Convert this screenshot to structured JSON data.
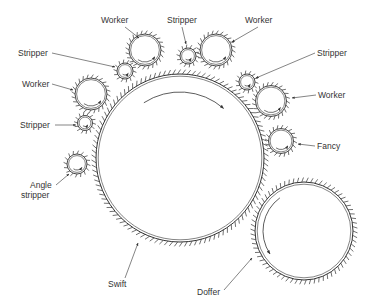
{
  "diagram": {
    "type": "carding-machine-roller-layout",
    "line_color": "#333333",
    "background": "#ffffff",
    "rollers": [
      {
        "id": "swift",
        "label": "Swift",
        "cx": 180,
        "cy": 158,
        "r": 84,
        "teeth": 110,
        "arrow": "clockwise-top"
      },
      {
        "id": "doffer",
        "label": "Doffer",
        "cx": 304,
        "cy": 231,
        "r": 49,
        "teeth": 70,
        "arrow": "counterclockwise-left"
      },
      {
        "id": "worker-top-left",
        "label": "Worker",
        "cx": 145,
        "cy": 50,
        "r": 16,
        "teeth": 24
      },
      {
        "id": "stripper-top",
        "label": "Stripper",
        "cx": 188,
        "cy": 56,
        "r": 8,
        "teeth": 14
      },
      {
        "id": "worker-top-right",
        "label": "Worker",
        "cx": 216,
        "cy": 50,
        "r": 16,
        "teeth": 24
      },
      {
        "id": "stripper-upper-left",
        "label": "Stripper",
        "cx": 125,
        "cy": 71,
        "r": 8,
        "teeth": 14
      },
      {
        "id": "worker-left",
        "label": "Worker",
        "cx": 91,
        "cy": 94,
        "r": 16,
        "teeth": 24
      },
      {
        "id": "stripper-left",
        "label": "Stripper",
        "cx": 85,
        "cy": 123,
        "r": 7.5,
        "teeth": 14
      },
      {
        "id": "angle-stripper",
        "label": "Angle stripper",
        "cx": 77,
        "cy": 164,
        "r": 10,
        "teeth": 16
      },
      {
        "id": "stripper-right",
        "label": "Stripper",
        "cx": 247,
        "cy": 82,
        "r": 8,
        "teeth": 14
      },
      {
        "id": "worker-right",
        "label": "Worker",
        "cx": 271,
        "cy": 101,
        "r": 15.5,
        "teeth": 24
      },
      {
        "id": "fancy",
        "label": "Fancy",
        "cx": 281,
        "cy": 141,
        "r": 12.5,
        "teeth": 20
      }
    ],
    "labels": [
      {
        "id": "label-worker-top-left",
        "text": "Worker",
        "x": 101,
        "y": 23,
        "anchor": "start",
        "line": [
          125,
          27,
          139,
          38
        ]
      },
      {
        "id": "label-stripper-top",
        "text": "Stripper",
        "x": 167,
        "y": 23,
        "anchor": "start",
        "line": [
          182,
          27,
          186,
          44
        ]
      },
      {
        "id": "label-worker-top-right",
        "text": "Worker",
        "x": 245,
        "y": 23,
        "anchor": "start",
        "line": [
          258,
          27,
          232,
          42
        ]
      },
      {
        "id": "label-stripper-upper-left",
        "text": "Stripper",
        "x": 18,
        "y": 56,
        "anchor": "start",
        "line": [
          52,
          53,
          115,
          67
        ]
      },
      {
        "id": "label-worker-left",
        "text": "Worker",
        "x": 22,
        "y": 87,
        "anchor": "start",
        "line": [
          52,
          84,
          73,
          90
        ]
      },
      {
        "id": "label-stripper-left",
        "text": "Stripper",
        "x": 20,
        "y": 128,
        "anchor": "start",
        "line": [
          55,
          125,
          76,
          125
        ]
      },
      {
        "id": "label-angle-stripper-1",
        "text": "Angle",
        "x": 30,
        "y": 188,
        "anchor": "start",
        "line": [
          56,
          185,
          69,
          174
        ]
      },
      {
        "id": "label-angle-stripper-2",
        "text": "stripper",
        "x": 21,
        "y": 198,
        "anchor": "start"
      },
      {
        "id": "label-stripper-right",
        "text": "Stripper",
        "x": 317,
        "y": 56,
        "anchor": "start",
        "line": [
          315,
          53,
          256,
          78
        ]
      },
      {
        "id": "label-worker-right",
        "text": "Worker",
        "x": 318,
        "y": 98,
        "anchor": "start",
        "line": [
          316,
          95,
          292,
          98
        ]
      },
      {
        "id": "label-fancy",
        "text": "Fancy",
        "x": 317,
        "y": 149,
        "anchor": "start",
        "line": [
          315,
          146,
          298,
          144
        ]
      },
      {
        "id": "label-swift",
        "text": "Swift",
        "x": 108,
        "y": 287,
        "anchor": "start",
        "line": [
          125,
          278,
          138,
          243
        ]
      },
      {
        "id": "label-doffer",
        "text": "Doffer",
        "x": 197,
        "y": 295,
        "anchor": "start",
        "line": [
          224,
          290,
          252,
          258
        ]
      }
    ]
  }
}
